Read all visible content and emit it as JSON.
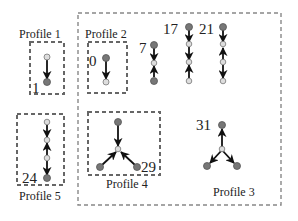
{
  "diagram": {
    "profiles": [
      {
        "label": "Profile 1",
        "nodes": [
          "1"
        ]
      },
      {
        "label": "Profile 2",
        "nodes": [
          "0"
        ]
      },
      {
        "label": "Profile 3",
        "nodes": [
          "7",
          "17",
          "21",
          "31"
        ]
      },
      {
        "label": "Profile 4",
        "nodes": [
          "29"
        ]
      },
      {
        "label": "Profile 5",
        "nodes": [
          "24"
        ]
      }
    ],
    "numbers": {
      "n0": "0",
      "n1": "1",
      "n7": "7",
      "n17": "17",
      "n21": "21",
      "n24": "24",
      "n29": "29",
      "n31": "31"
    },
    "colors": {
      "dark_node": "#777777",
      "light_node": "#dddddd",
      "box": "#666666"
    }
  }
}
